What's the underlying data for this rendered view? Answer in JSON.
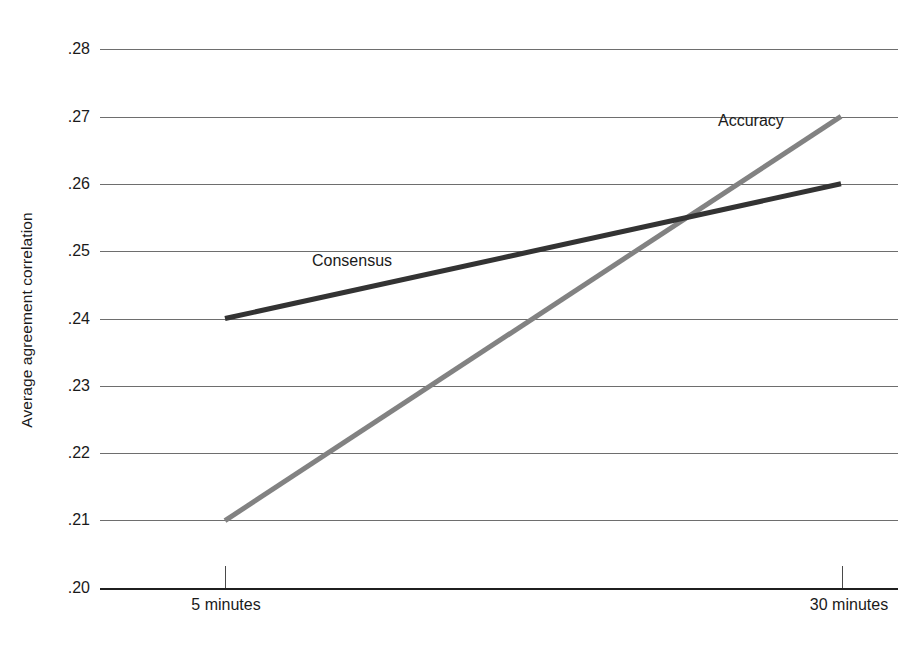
{
  "chart_data": {
    "type": "line",
    "title": "",
    "xlabel": "",
    "ylabel": "Average agreement correlation",
    "categories": [
      "5 minutes",
      "30 minutes"
    ],
    "x": [
      5,
      30
    ],
    "xtick_labels": [
      "5 minutes",
      "30 minutes"
    ],
    "ytick_labels": [
      ".28",
      ".27",
      ".26",
      ".25",
      ".24",
      ".23",
      ".22",
      ".21",
      ".20"
    ],
    "ytick_values": [
      0.28,
      0.27,
      0.26,
      0.25,
      0.24,
      0.23,
      0.22,
      0.21,
      0.2
    ],
    "ylim": [
      0.2,
      0.28
    ],
    "grid": true,
    "legend_position": "inline-labels",
    "series": [
      {
        "name": "Consensus",
        "values": [
          0.24,
          0.26
        ],
        "color": "#333333",
        "label_text": "Consensus"
      },
      {
        "name": "Accuracy",
        "values": [
          0.21,
          0.27
        ],
        "color": "#828282",
        "label_text": "Accuracy"
      }
    ],
    "annotations": [
      {
        "text": "Consensus",
        "series": "Consensus"
      },
      {
        "text": "Accuracy",
        "series": "Accuracy"
      }
    ]
  },
  "axes": {
    "y_title": "Average agreement correlation",
    "y_ticks": [
      {
        "label": ".28"
      },
      {
        "label": ".27"
      },
      {
        "label": ".26"
      },
      {
        "label": ".25"
      },
      {
        "label": ".24"
      },
      {
        "label": ".23"
      },
      {
        "label": ".22"
      },
      {
        "label": ".21"
      },
      {
        "label": ".20"
      }
    ],
    "x_ticks": [
      {
        "label": "5 minutes"
      },
      {
        "label": "30 minutes"
      }
    ]
  },
  "colors": {
    "consensus_line": "#333333",
    "accuracy_line": "#828282",
    "gridline": "#6e6e6e",
    "axis": "#1f1f1f",
    "text": "#1a1a1a",
    "background": "#ffffff"
  }
}
